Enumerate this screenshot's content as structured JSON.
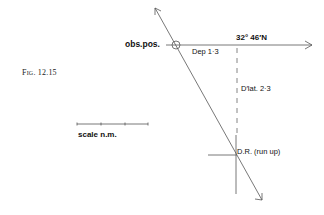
{
  "figure": {
    "caption": "Fig. 12.15"
  },
  "labels": {
    "obs_pos": "obs.pos.",
    "departure": "Dep 1·3",
    "latitude": "32° 46′N",
    "d_lat": "D′lat. 2·3",
    "dr": "D.R. (run up)",
    "scale": "scale  n.m."
  },
  "scale_bar": {
    "ticks": 4
  },
  "colors": {
    "line": "#555555",
    "text": "#111111"
  }
}
